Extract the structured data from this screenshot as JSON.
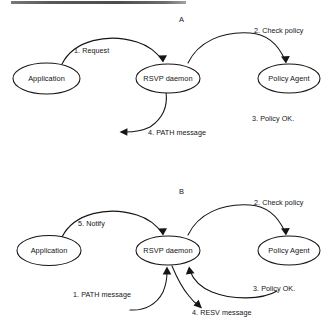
{
  "figure": {
    "type": "flow-diagram",
    "background_color": "#ffffff",
    "stroke_color": "#151515",
    "text_color": "#141414"
  },
  "panels": [
    {
      "id": "A",
      "label": "A",
      "nodes": [
        {
          "id": "application",
          "label": "Application"
        },
        {
          "id": "rsvp_daemon",
          "label": "RSVP daemon"
        },
        {
          "id": "policy_agent",
          "label": "Policy Agent"
        }
      ],
      "edges": [
        {
          "id": "a1",
          "label": "1. Request",
          "from": "application",
          "to": "rsvp_daemon"
        },
        {
          "id": "a2",
          "label": "2. Check policy",
          "from": "rsvp_daemon",
          "to": "policy_agent"
        },
        {
          "id": "a3",
          "label": "3. Policy OK.",
          "from": "policy_agent",
          "to": "rsvp_daemon"
        },
        {
          "id": "a4",
          "label": "4. PATH message",
          "from": "rsvp_daemon",
          "to": "network"
        }
      ]
    },
    {
      "id": "B",
      "label": "B",
      "nodes": [
        {
          "id": "application",
          "label": "Application"
        },
        {
          "id": "rsvp_daemon",
          "label": "RSVP daemon"
        },
        {
          "id": "policy_agent",
          "label": "Policy Agent"
        }
      ],
      "edges": [
        {
          "id": "b1",
          "label": "1. PATH message",
          "from": "network",
          "to": "rsvp_daemon"
        },
        {
          "id": "b2",
          "label": "2. Check policy",
          "from": "rsvp_daemon",
          "to": "policy_agent"
        },
        {
          "id": "b3",
          "label": "3. Policy OK.",
          "from": "policy_agent",
          "to": "rsvp_daemon"
        },
        {
          "id": "b4",
          "label": "4. RESV message",
          "from": "rsvp_daemon",
          "to": "network"
        },
        {
          "id": "b5",
          "label": "5. Notify",
          "from": "rsvp_daemon",
          "to": "application"
        }
      ]
    }
  ]
}
